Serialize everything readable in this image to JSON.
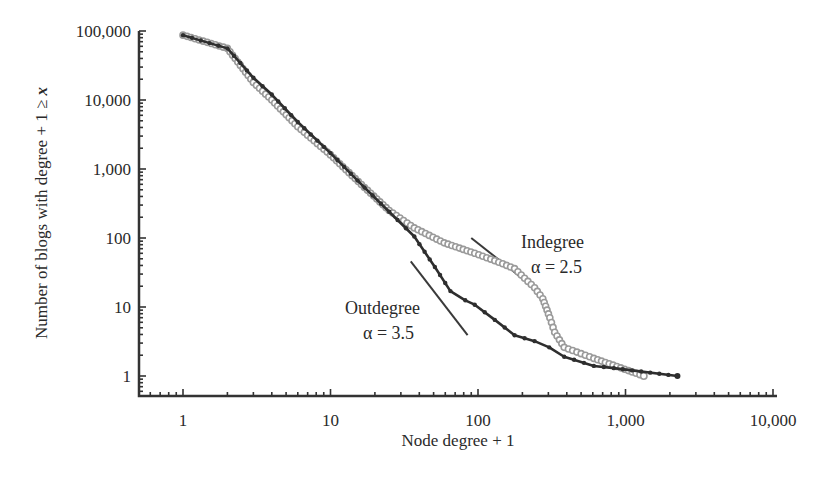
{
  "chart_data": {
    "type": "line",
    "title": "",
    "xlabel": "Node degree + 1",
    "ylabel": "Number of blogs with degree + 1 ≥ x",
    "xscale": "log",
    "yscale": "log",
    "xlim": [
      0.5,
      10000
    ],
    "ylim": [
      0.5,
      100000
    ],
    "xticks": [
      1,
      10,
      100,
      1000,
      10000
    ],
    "xtick_labels": [
      "1",
      "10",
      "100",
      "1,000",
      "10,000"
    ],
    "yticks": [
      1,
      10,
      100,
      1000,
      10000,
      100000
    ],
    "ytick_labels": [
      "1",
      "10",
      "100",
      "1,000",
      "10,000",
      "100,000"
    ],
    "grid": false,
    "legend": "none (inline annotations)",
    "series": [
      {
        "name": "Outdegree",
        "color": "#2e2e2e",
        "marker": "filled-circle",
        "x": [
          1,
          2,
          3,
          4,
          6,
          10,
          17,
          25,
          37,
          51,
          65,
          82,
          95,
          130,
          177,
          242,
          304,
          384,
          610,
          834,
          2250
        ],
        "y": [
          87000,
          56000,
          21000,
          12000,
          4800,
          1700,
          540,
          240,
          105,
          38,
          17,
          12.5,
          10.8,
          6.5,
          3.9,
          3.2,
          2.6,
          1.9,
          1.4,
          1.3,
          1.0
        ]
      },
      {
        "name": "Indegree",
        "color": "#9a9a9a",
        "marker": "open-circle",
        "x": [
          1,
          2,
          3,
          4,
          6,
          10,
          17,
          25,
          37,
          59,
          95,
          130,
          177,
          242,
          275,
          307,
          331,
          384,
          610,
          1330
        ],
        "y": [
          87000,
          56000,
          18000,
          10000,
          4100,
          1600,
          540,
          250,
          140,
          85,
          60,
          47,
          36,
          19,
          13.2,
          7.0,
          4.3,
          2.6,
          1.8,
          1.0
        ]
      }
    ],
    "reference_lines": [
      {
        "label": "Indegree",
        "slope_label": "α = 2.5",
        "from": [
          90,
          100
        ],
        "to": [
          200,
          26
        ]
      },
      {
        "label": "Outdegree",
        "slope_label": "α = 3.5",
        "from": [
          35,
          46
        ],
        "to": [
          85,
          3.9
        ]
      }
    ],
    "annotations": [
      {
        "text": "Indegree",
        "at": [
          520,
          248
        ]
      },
      {
        "text": "α = 2.5",
        "at": [
          530,
          272
        ]
      },
      {
        "text": "Outdegree",
        "at": [
          345,
          314
        ]
      },
      {
        "text": "α = 3.5",
        "at": [
          362,
          338
        ]
      }
    ]
  },
  "labels": {
    "xlabel": "Node degree + 1",
    "ylabel_prefix": "Number of blogs with degree + 1 ≥ ",
    "ylabel_var": "x",
    "indegree_name": "Indegree",
    "indegree_alpha": "α = 2.5",
    "outdegree_name": "Outdegree",
    "outdegree_alpha": "α = 3.5"
  }
}
